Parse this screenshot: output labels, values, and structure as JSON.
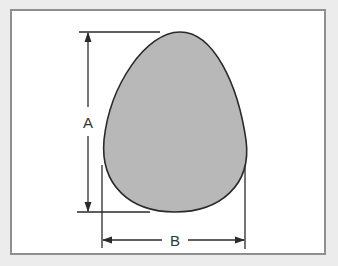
{
  "diagram": {
    "labels": {
      "height": "A",
      "width": "B"
    },
    "colors": {
      "background": "#ececec",
      "frame_fill": "#ffffff",
      "frame_border": "#8f8f8f",
      "egg_fill": "#b8b8b8",
      "egg_outline": "#2a2a2a",
      "line": "#2a2a2a"
    },
    "dimensions": [
      {
        "name": "A",
        "meaning": "height of egg",
        "orientation": "vertical"
      },
      {
        "name": "B",
        "meaning": "width of egg",
        "orientation": "horizontal"
      }
    ]
  }
}
